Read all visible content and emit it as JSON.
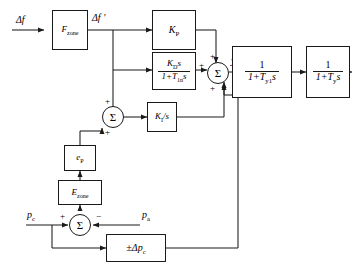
{
  "diagram": {
    "type": "control-block-diagram",
    "stroke_color": "#1a1a1a",
    "background_color": "#ffffff"
  },
  "signals": {
    "input_df": "Δf",
    "df_prime": "Δf ′",
    "y_pid": "y",
    "y_pid_sub": "PID",
    "output_y": "y",
    "p_c": "p",
    "p_c_sub": "c",
    "p_a": "p",
    "p_a_sub": "a"
  },
  "blocks": [
    {
      "id": "f-zone",
      "name": "f-zone-block",
      "label_main": "F",
      "label_sub": "zone",
      "kind": "simple"
    },
    {
      "id": "kp",
      "name": "proportional-gain-block",
      "label_main": "K",
      "label_sub": "P",
      "kind": "simple"
    },
    {
      "id": "kd",
      "name": "derivative-block",
      "kind": "fraction",
      "numerator_main": "K",
      "numerator_sub": "D",
      "numerator_tail": "s",
      "denominator_lead": "1+T",
      "denominator_sub": "1n",
      "denominator_tail": "s"
    },
    {
      "id": "ki",
      "name": "integral-gain-block",
      "label_main": "K",
      "label_sub": "I",
      "label_tail": "/s",
      "kind": "simple"
    },
    {
      "id": "ep",
      "name": "pressure-error-block",
      "label_main": "e",
      "label_sub": "P",
      "kind": "simple"
    },
    {
      "id": "e-zone",
      "name": "e-zone-block",
      "label_main": "E",
      "label_sub": "zone",
      "kind": "simple"
    },
    {
      "id": "dpc",
      "name": "pressure-deviation-block",
      "label_main": "±Δp",
      "label_sub": "c",
      "kind": "simple"
    },
    {
      "id": "ty1",
      "name": "first-lag-block",
      "kind": "fraction",
      "numerator_main": "1",
      "denominator_lead": "1+T",
      "denominator_sub": "y1",
      "denominator_tail": "s"
    },
    {
      "id": "ty",
      "name": "second-lag-block",
      "kind": "fraction",
      "numerator_main": "1",
      "denominator_lead": "1+T",
      "denominator_sub": "y",
      "denominator_tail": "s"
    }
  ],
  "summing_junctions": [
    {
      "id": "sum-main",
      "name": "main-summing-junction",
      "glyph": "Σ",
      "signs": [
        "+",
        "+",
        "+"
      ]
    },
    {
      "id": "sum-mid",
      "name": "integral-input-summing-junction",
      "glyph": "Σ",
      "signs": [
        "+",
        "+"
      ]
    },
    {
      "id": "sum-bottom",
      "name": "pressure-summing-junction",
      "glyph": "Σ",
      "signs": [
        "+",
        "−"
      ]
    }
  ],
  "signs": {
    "plus": "+",
    "minus": "−"
  }
}
